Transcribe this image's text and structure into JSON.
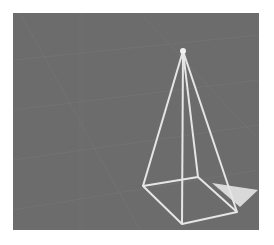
{
  "scene": {
    "description": "3D wireframe square pyramid on gray grid background",
    "background_color": "#6c6c6c",
    "line_color": "#e6e6e6",
    "shadow_color": "#d9d9d9",
    "apex": [
      183,
      51
    ],
    "base": [
      [
        143,
        186
      ],
      [
        198,
        177
      ],
      [
        237,
        212
      ],
      [
        182,
        224
      ]
    ],
    "shadow_triangle": [
      [
        212,
        183
      ],
      [
        258,
        190
      ],
      [
        240,
        207
      ]
    ]
  }
}
